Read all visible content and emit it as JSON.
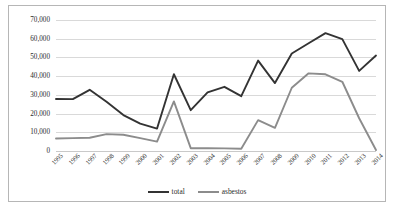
{
  "chart_data": {
    "type": "line",
    "title": "",
    "subtitle": "",
    "xlabel": "",
    "ylabel": "",
    "ylim": [
      0,
      70000
    ],
    "ytick_labels": [
      "0",
      "10,000",
      "20,000",
      "30,000",
      "40,000",
      "50,000",
      "60,000",
      "70,000"
    ],
    "ytick_values": [
      0,
      10000,
      20000,
      30000,
      40000,
      50000,
      60000,
      70000
    ],
    "grid": true,
    "legend_position": "bottom-center",
    "categories": [
      "1995",
      "1996",
      "1997",
      "1998",
      "1999",
      "2000",
      "2001",
      "2002",
      "2003",
      "2004",
      "2005",
      "2006",
      "2007",
      "2008",
      "2009",
      "2010",
      "2011",
      "2012",
      "2013",
      "2014"
    ],
    "series": [
      {
        "name": "total",
        "color": "#333333",
        "values": [
          27800,
          27700,
          32700,
          26300,
          19200,
          14600,
          12000,
          41000,
          21800,
          31300,
          34300,
          29300,
          48300,
          36300,
          52100,
          57600,
          63000,
          59800,
          42800,
          51000
        ]
      },
      {
        "name": "asbestos",
        "color": "#8c8c8c",
        "values": [
          6700,
          6900,
          7100,
          9000,
          8700,
          6900,
          5000,
          26500,
          1500,
          1500,
          1400,
          1200,
          16500,
          12400,
          33800,
          41500,
          41000,
          37000,
          17500,
          500
        ]
      }
    ],
    "series_override_note": ""
  },
  "axis": {
    "y_labels": [
      "70,000",
      "60,000",
      "50,000",
      "40,000",
      "30,000",
      "20,000",
      "10,000",
      "0"
    ],
    "x_labels": [
      "1995",
      "1996",
      "1997",
      "1998",
      "1999",
      "2000",
      "2001",
      "2002",
      "2003",
      "2004",
      "2005",
      "2006",
      "2007",
      "2008",
      "2009",
      "2010",
      "2011",
      "2012",
      "2013",
      "2014"
    ]
  },
  "legend": {
    "items": [
      {
        "label": "total",
        "color": "#333333"
      },
      {
        "label": "asbestos",
        "color": "#8c8c8c"
      }
    ]
  },
  "style": {
    "background": "#ffffff",
    "border_color": "#b6b6b6",
    "gridline_color": "#d9d9d9"
  }
}
